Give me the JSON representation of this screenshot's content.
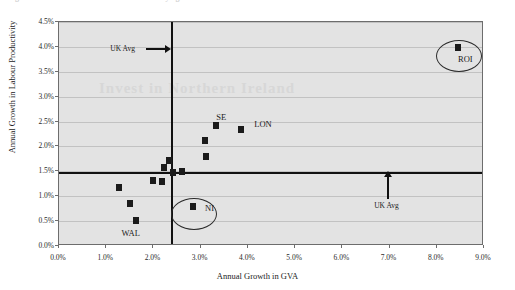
{
  "chart_data": {
    "type": "scatter",
    "title": "Figure: Annual Growth in Labour Productivity against Annual Growth in GVA",
    "watermark": "Invest in Northern Ireland",
    "xlabel": "Annual Growth in GVA",
    "ylabel": "Annual Growth in Labour Productivity",
    "xlim": [
      0.0,
      9.0
    ],
    "ylim": [
      0.0,
      4.5
    ],
    "xticks": [
      "0.0%",
      "1.0%",
      "2.0%",
      "3.0%",
      "4.0%",
      "5.0%",
      "6.0%",
      "7.0%",
      "8.0%",
      "9.0%"
    ],
    "xtick_values": [
      0.0,
      1.0,
      2.0,
      3.0,
      4.0,
      5.0,
      6.0,
      7.0,
      8.0,
      9.0
    ],
    "yticks": [
      "0.0%",
      "0.5%",
      "1.0%",
      "1.5%",
      "2.0%",
      "2.5%",
      "3.0%",
      "3.5%",
      "4.0%",
      "4.5%"
    ],
    "ytick_values": [
      0.0,
      0.5,
      1.0,
      1.5,
      2.0,
      2.5,
      3.0,
      3.5,
      4.0,
      4.5
    ],
    "grid": true,
    "legend": "none",
    "points": [
      {
        "label": "ROI",
        "x": 8.45,
        "y": 3.98,
        "label_dx": 0,
        "label_dy": 11,
        "circled": true
      },
      {
        "label": "SE",
        "x": 3.33,
        "y": 2.43,
        "label_dx": 0,
        "label_dy": -8,
        "circled": false
      },
      {
        "label": "LON",
        "x": 3.86,
        "y": 2.35,
        "label_dx": 13,
        "label_dy": -5,
        "circled": false
      },
      {
        "label": "NI",
        "x": 2.84,
        "y": 0.8,
        "label_dx": 12,
        "label_dy": 2,
        "circled": true
      },
      {
        "label": "WAL",
        "x": 1.62,
        "y": 0.52,
        "label_dx": -14,
        "label_dy": 13,
        "circled": false
      },
      {
        "label": "",
        "x": 1.28,
        "y": 1.18,
        "label_dx": 0,
        "label_dy": 0,
        "circled": false
      },
      {
        "label": "",
        "x": 1.5,
        "y": 0.86,
        "label_dx": 0,
        "label_dy": 0,
        "circled": false
      },
      {
        "label": "",
        "x": 2.0,
        "y": 1.32,
        "label_dx": 0,
        "label_dy": 0,
        "circled": false
      },
      {
        "label": "",
        "x": 2.18,
        "y": 1.3,
        "label_dx": 0,
        "label_dy": 0,
        "circled": false
      },
      {
        "label": "",
        "x": 2.22,
        "y": 1.58,
        "label_dx": 0,
        "label_dy": 0,
        "circled": false
      },
      {
        "label": "",
        "x": 2.33,
        "y": 1.72,
        "label_dx": 0,
        "label_dy": 0,
        "circled": false
      },
      {
        "label": "",
        "x": 2.42,
        "y": 1.47,
        "label_dx": 0,
        "label_dy": 0,
        "circled": false
      },
      {
        "label": "",
        "x": 2.6,
        "y": 1.5,
        "label_dx": 0,
        "label_dy": 0,
        "circled": false
      },
      {
        "label": "",
        "x": 3.12,
        "y": 1.8,
        "label_dx": 0,
        "label_dy": 0,
        "circled": false
      },
      {
        "label": "",
        "x": 3.1,
        "y": 2.12,
        "label_dx": 0,
        "label_dy": 0,
        "circled": false
      }
    ],
    "reference_lines": [
      {
        "name": "uk-avg-gva",
        "orientation": "vertical",
        "value": 2.4,
        "label": "UK Avg"
      },
      {
        "name": "uk-avg-productivity",
        "orientation": "horizontal",
        "value": 1.47,
        "label": "UK Avg"
      }
    ],
    "annotations": [
      {
        "name": "uk-avg-vertical-annotation",
        "label": "UK Avg",
        "x_pct": 2.4,
        "y_pct": 3.95,
        "arrow": "right"
      },
      {
        "name": "uk-avg-horizontal-annotation",
        "label": "UK Avg",
        "x_pct": 6.95,
        "y_pct": 1.47,
        "arrow": "up"
      }
    ],
    "colors": {
      "plot_background": "#e3e3e3",
      "marker": "#1b1b1b",
      "gridline": "#c2c2c2",
      "reference_line": "#111111",
      "frame": "#6d6d6d"
    }
  }
}
